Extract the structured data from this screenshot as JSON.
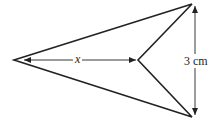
{
  "diagram": {
    "type": "arrowhead-kite (concave quadrilateral / dart)",
    "labels": {
      "horizontal": "x",
      "vertical": "3 cm"
    },
    "vertices": {
      "left_tip": [
        14,
        60
      ],
      "top_right": [
        192,
        4
      ],
      "inner": [
        138,
        60
      ],
      "bottom_right": [
        192,
        117
      ]
    },
    "colors": {
      "stroke": "#222222",
      "background": "#ffffff"
    }
  }
}
